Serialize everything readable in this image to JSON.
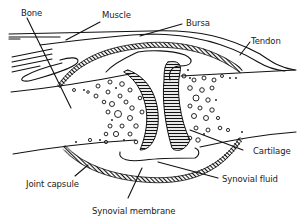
{
  "diagram": {
    "labels": {
      "bone": "Bone",
      "muscle": "Muscle",
      "bursa": "Bursa",
      "tendon": "Tendon",
      "cartilage": "Cartilage",
      "synovial_fluid": "Synovial fluid",
      "synovial_membrane": "Synovial membrane",
      "joint_capsule": "Joint capsule"
    },
    "colors": {
      "ink": "#111111",
      "background": "#ffffff"
    }
  }
}
